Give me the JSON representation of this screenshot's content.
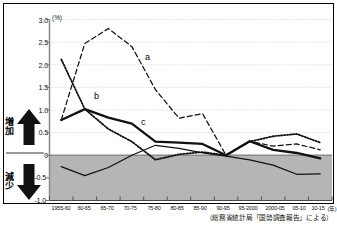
{
  "figure": {
    "unit_label": "(%)",
    "source_note": "（総務省統計局「国勢調査報告」による）",
    "left_axis_annotations": {
      "increase_label": "増加",
      "increase_icon": "up-arrow-icon",
      "decrease_label": "減少",
      "decrease_icon": "down-arrow-icon"
    }
  },
  "chart_data": {
    "type": "line",
    "title": "",
    "subtitle": "",
    "xlabel": "",
    "ylabel": "(%)",
    "ylim": [
      -1.0,
      3.0
    ],
    "grid": true,
    "legend_position": "inline-labels",
    "y_ticks": [
      "3.0",
      "2.5",
      "2.0",
      "1.5",
      "1.0",
      "0.5",
      "0",
      "-0.5",
      "-1.0"
    ],
    "y_tick_values": [
      3.0,
      2.5,
      2.0,
      1.5,
      1.0,
      0.5,
      0,
      -0.5,
      -1.0
    ],
    "categories": [
      "1955-60",
      "60-65",
      "65-70",
      "70-75",
      "75-80",
      "80-85",
      "85-90",
      "90-95",
      "95-2000",
      "2000-05",
      "05-10",
      "10-15"
    ],
    "x_axis_suffix": "(年)",
    "negative_region_shaded": true,
    "zero_line": 0,
    "series": [
      {
        "name": "a",
        "label": "a",
        "style": "dashed",
        "width": "thin",
        "values": [
          0.78,
          2.47,
          2.8,
          2.4,
          1.45,
          0.82,
          0.92,
          0.0,
          0.31,
          0.2,
          0.25,
          0.12
        ]
      },
      {
        "name": "b",
        "label": "b",
        "style": "dotted",
        "width": "thin",
        "values": [
          2.12,
          1.02,
          0.58,
          0.3,
          -0.1,
          0.02,
          0.07,
          0.0,
          0.3,
          0.42,
          0.47,
          0.28
        ]
      },
      {
        "name": "c",
        "label": "c",
        "style": "solid",
        "width": "thick",
        "values": [
          0.78,
          1.02,
          0.83,
          0.7,
          0.3,
          0.28,
          0.25,
          0.0,
          0.31,
          0.12,
          0.05,
          -0.07
        ]
      },
      {
        "name": "d",
        "label": "d",
        "style": "solid",
        "width": "thin",
        "values": [
          -0.25,
          -0.45,
          -0.27,
          0.0,
          0.22,
          0.15,
          0.05,
          -0.02,
          -0.1,
          -0.22,
          -0.42,
          -0.41
        ]
      }
    ]
  }
}
